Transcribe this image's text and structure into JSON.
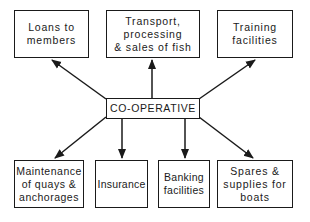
{
  "diagram": {
    "center": {
      "label": "CO-OPERATIVE"
    },
    "nodes": [
      {
        "id": "loans",
        "label": "Loans to\nmembers"
      },
      {
        "id": "transport",
        "label": "Transport,\nprocessing\n& sales of fish"
      },
      {
        "id": "training",
        "label": "Training\nfacilities"
      },
      {
        "id": "maintenance",
        "label": "Maintenance\nof quays &\nanchorages"
      },
      {
        "id": "insurance",
        "label": "Insurance"
      },
      {
        "id": "banking",
        "label": "Banking\nfacilities"
      },
      {
        "id": "spares",
        "label": "Spares &\nsupplies for\nboats"
      }
    ],
    "edges": [
      {
        "from": "CO-OPERATIVE",
        "to": "Loans to members"
      },
      {
        "from": "CO-OPERATIVE",
        "to": "Transport, processing & sales of fish"
      },
      {
        "from": "CO-OPERATIVE",
        "to": "Training facilities"
      },
      {
        "from": "CO-OPERATIVE",
        "to": "Maintenance of quays & anchorages"
      },
      {
        "from": "CO-OPERATIVE",
        "to": "Insurance"
      },
      {
        "from": "CO-OPERATIVE",
        "to": "Banking facilities"
      },
      {
        "from": "CO-OPERATIVE",
        "to": "Spares & supplies for boats"
      }
    ]
  }
}
